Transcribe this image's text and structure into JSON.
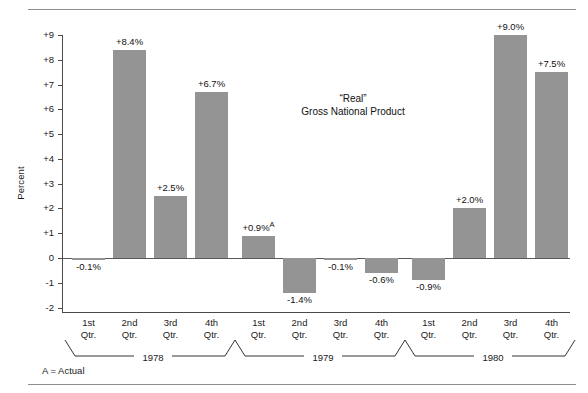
{
  "chart_data": {
    "type": "bar",
    "title": "“Real”",
    "subtitle": "Gross National Product",
    "xlabel": "",
    "ylabel": "Percent",
    "ylim": [
      -2,
      9
    ],
    "ytick_labels": [
      "+9",
      "+8",
      "+7",
      "+6",
      "+5",
      "+4",
      "+3",
      "+2",
      "+1",
      "0",
      "-1",
      "-2"
    ],
    "ytick_values": [
      9,
      8,
      7,
      6,
      5,
      4,
      3,
      2,
      1,
      0,
      -1,
      -2
    ],
    "grid": false,
    "legend": "none",
    "bar_color": "#949494",
    "categories": [
      "1st Qtr.",
      "2nd Qtr.",
      "3rd Qtr.",
      "4th Qtr.",
      "1st Qtr.",
      "2nd Qtr.",
      "3rd Qtr.",
      "4th Qtr.",
      "1st Qtr.",
      "2nd Qtr.",
      "3rd Qtr.",
      "4th Qtr."
    ],
    "values": [
      -0.1,
      8.4,
      2.5,
      6.7,
      0.9,
      -1.4,
      -0.1,
      -0.6,
      -0.9,
      2.0,
      9.0,
      7.5
    ],
    "value_labels": [
      "-0.1%",
      "+8.4%",
      "+2.5%",
      "+6.7%",
      "+0.9%",
      "-1.4%",
      "-0.1%",
      "-0.6%",
      "-0.9%",
      "+2.0%",
      "+9.0%",
      "+7.5%"
    ],
    "annotations": [
      {
        "index": 4,
        "marker": "A",
        "meaning": "Actual"
      }
    ],
    "groups": [
      {
        "label": "1978",
        "indices": [
          0,
          1,
          2,
          3
        ]
      },
      {
        "label": "1979",
        "indices": [
          4,
          5,
          6,
          7
        ]
      },
      {
        "label": "1980",
        "indices": [
          8,
          9,
          10,
          11
        ]
      }
    ],
    "footnote": "A = Actual"
  },
  "axis": {
    "y_title": "Percent",
    "ticks": [
      {
        "label": "+9",
        "value": 9
      },
      {
        "label": "+8",
        "value": 8
      },
      {
        "label": "+7",
        "value": 7
      },
      {
        "label": "+6",
        "value": 6
      },
      {
        "label": "+5",
        "value": 5
      },
      {
        "label": "+4",
        "value": 4
      },
      {
        "label": "+3",
        "value": 3
      },
      {
        "label": "+2",
        "value": 2
      },
      {
        "label": "+1",
        "value": 1
      },
      {
        "label": "0",
        "value": 0
      },
      {
        "label": "-1",
        "value": -1
      },
      {
        "label": "-2",
        "value": -2
      }
    ]
  },
  "title": {
    "line1": "“Real”",
    "line2": "Gross National Product"
  },
  "quarters": [
    {
      "line1": "1st",
      "line2": "Qtr."
    },
    {
      "line1": "2nd",
      "line2": "Qtr."
    },
    {
      "line1": "3rd",
      "line2": "Qtr."
    },
    {
      "line1": "4th",
      "line2": "Qtr."
    },
    {
      "line1": "1st",
      "line2": "Qtr."
    },
    {
      "line1": "2nd",
      "line2": "Qtr."
    },
    {
      "line1": "3rd",
      "line2": "Qtr."
    },
    {
      "line1": "4th",
      "line2": "Qtr."
    },
    {
      "line1": "1st",
      "line2": "Qtr."
    },
    {
      "line1": "2nd",
      "line2": "Qtr."
    },
    {
      "line1": "3rd",
      "line2": "Qtr."
    },
    {
      "line1": "4th",
      "line2": "Qtr."
    }
  ],
  "years": [
    {
      "label": "1978"
    },
    {
      "label": "1979"
    },
    {
      "label": "1980"
    }
  ],
  "footnote": {
    "text": "A = Actual"
  }
}
